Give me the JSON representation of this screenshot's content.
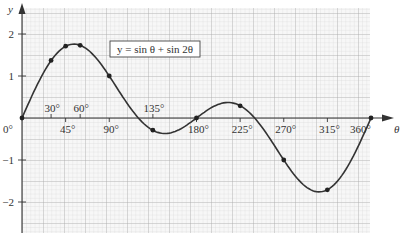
{
  "chart_data": {
    "type": "line",
    "title": "",
    "equation_label": "y =  sin θ + sin 2θ",
    "xlabel": "θ",
    "ylabel": "y",
    "xlim": [
      0,
      360
    ],
    "ylim": [
      -2.6,
      2.6
    ],
    "grid": true,
    "x_tick_labels_above": [
      "30°",
      "60°",
      "135°"
    ],
    "x_tick_labels_below": [
      "0°",
      "45°",
      "90°",
      "180°",
      "225°",
      "270°",
      "315°",
      "360°"
    ],
    "y_tick_labels": [
      "2",
      "1",
      "−1",
      "−2"
    ],
    "series": [
      {
        "name": "y = sin θ + sin 2θ",
        "x": [
          0,
          30,
          45,
          60,
          90,
          135,
          180,
          225,
          270,
          315,
          360
        ],
        "values": [
          0,
          1.37,
          1.71,
          1.73,
          1.0,
          -0.29,
          0,
          0.29,
          -1.0,
          -1.71,
          0
        ]
      }
    ],
    "marked_points": [
      {
        "x": 0,
        "y": 0
      },
      {
        "x": 30,
        "y": 1.37
      },
      {
        "x": 45,
        "y": 1.71
      },
      {
        "x": 60,
        "y": 1.73
      },
      {
        "x": 90,
        "y": 1.0
      },
      {
        "x": 135,
        "y": -0.29
      },
      {
        "x": 180,
        "y": 0
      },
      {
        "x": 225,
        "y": 0.29
      },
      {
        "x": 270,
        "y": -1.0
      },
      {
        "x": 315,
        "y": -1.71
      },
      {
        "x": 360,
        "y": 0
      }
    ]
  },
  "labels": {
    "y_axis": "y",
    "x_axis": "θ",
    "equation": "y =  sin θ + sin 2θ",
    "x_above": [
      {
        "deg": 30,
        "text": "30°"
      },
      {
        "deg": 60,
        "text": "60°"
      },
      {
        "deg": 135,
        "text": "135°"
      }
    ],
    "x_below": [
      {
        "deg": 45,
        "text": "45°"
      },
      {
        "deg": 90,
        "text": "90°"
      },
      {
        "deg": 180,
        "text": "180°"
      },
      {
        "deg": 225,
        "text": "225°"
      },
      {
        "deg": 270,
        "text": "270°"
      },
      {
        "deg": 315,
        "text": "315°"
      }
    ],
    "origin": "0°",
    "end": "360°",
    "y_ticks": [
      {
        "v": 2,
        "text": "2"
      },
      {
        "v": 1,
        "text": "1"
      },
      {
        "v": -1,
        "text": "−1"
      },
      {
        "v": -2,
        "text": "−2"
      }
    ]
  }
}
